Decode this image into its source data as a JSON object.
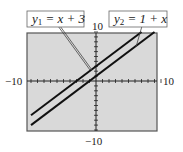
{
  "chart_data": {
    "type": "line",
    "title": "",
    "xlabel": "",
    "ylabel": "",
    "xlim": [
      -10,
      10
    ],
    "ylim": [
      -10,
      10
    ],
    "grid": false,
    "tick_spacing": 1,
    "axis_labels": {
      "x_min": "−10",
      "x_max": "10",
      "y_min": "−10",
      "y_max": "10"
    },
    "series": [
      {
        "name": "y1 = x + 3",
        "equation": "y = x + 3",
        "slope": 1,
        "intercept": 3,
        "x": [
          -10,
          7
        ],
        "y": [
          -7,
          10
        ]
      },
      {
        "name": "y2 = 1 + x",
        "equation": "y = 1 + x",
        "slope": 1,
        "intercept": 1,
        "x": [
          -10,
          9
        ],
        "y": [
          -9,
          10
        ]
      }
    ],
    "annotations": [
      {
        "text": "y1 = x + 3",
        "pointer_to": "y1"
      },
      {
        "text": "y2 = 1 + x",
        "pointer_to": "y2"
      }
    ],
    "background": "#d9d9d9",
    "line_color": "#111111"
  },
  "labels": {
    "ymax": "10",
    "xmin": "−10",
    "xmax": "10",
    "ymin": "−10",
    "y1_var": "y",
    "y1_sub": "1",
    "y1_rhs": " = x + 3",
    "y2_var": "y",
    "y2_sub": "2",
    "y2_rhs": " = 1 + x"
  }
}
